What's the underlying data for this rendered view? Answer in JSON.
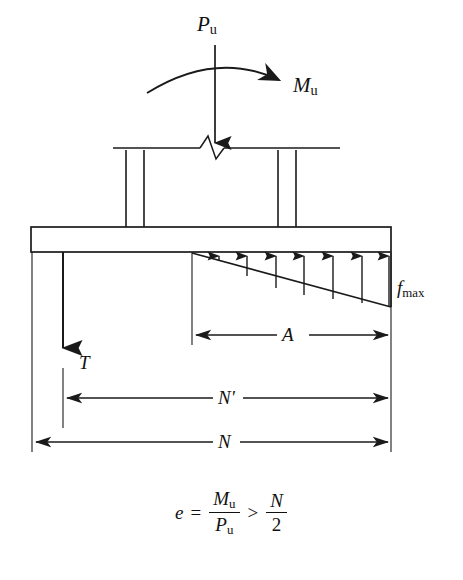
{
  "figure": {
    "type": "engineering-free-body-diagram"
  },
  "labels": {
    "axial_load": {
      "symbol": "P",
      "subscript": "u",
      "text": "Pu"
    },
    "moment": {
      "symbol": "M",
      "subscript": "u",
      "text": "Mu"
    },
    "max_bearing_stress": {
      "symbol": "f",
      "subscript": "max",
      "text": "fmax"
    },
    "tension": {
      "symbol": "T",
      "text": "T"
    },
    "bearing_length": {
      "symbol": "A",
      "text": "A"
    },
    "anchor_to_edge": {
      "symbol": "N'",
      "text": "N'"
    },
    "plate_length": {
      "symbol": "N",
      "text": "N"
    }
  },
  "equation": {
    "lhs": "e",
    "equals": "=",
    "numerator_1": "M",
    "numerator_1_sub": "u",
    "denominator_1": "P",
    "denominator_1_sub": "u",
    "relation": ">",
    "numerator_2": "N",
    "denominator_2": "2"
  },
  "colors": {
    "stroke": "#1a1a1a",
    "background": "#ffffff",
    "text": "#111111"
  },
  "geometry": {
    "plate": {
      "x": 31,
      "y": 227,
      "width": 360,
      "height": 25
    },
    "column": {
      "top_y": 148,
      "left_flange_x": [
        126,
        144
      ],
      "right_flange_x": [
        278,
        296
      ],
      "break_center_x": 215
    },
    "stress_triangle": {
      "apex_x": 192,
      "base_x": 391,
      "top_y": 252,
      "bottom_y": 307
    },
    "arrow_count": 7,
    "dimensions": {
      "A": {
        "x1": 192,
        "x2": 391,
        "y": 335
      },
      "N'": {
        "x1": 63,
        "x2": 391,
        "y": 398
      },
      "N": {
        "x1": 32,
        "x2": 391,
        "y": 442
      }
    },
    "tension_arrow": {
      "x": 63,
      "y1": 252,
      "y2": 355
    },
    "load_arrow": {
      "x": 215,
      "y1": 48,
      "y2": 152
    },
    "moment_arc": {
      "start": [
        148,
        92
      ],
      "peak": [
        215,
        58
      ],
      "end": [
        285,
        84
      ]
    }
  }
}
